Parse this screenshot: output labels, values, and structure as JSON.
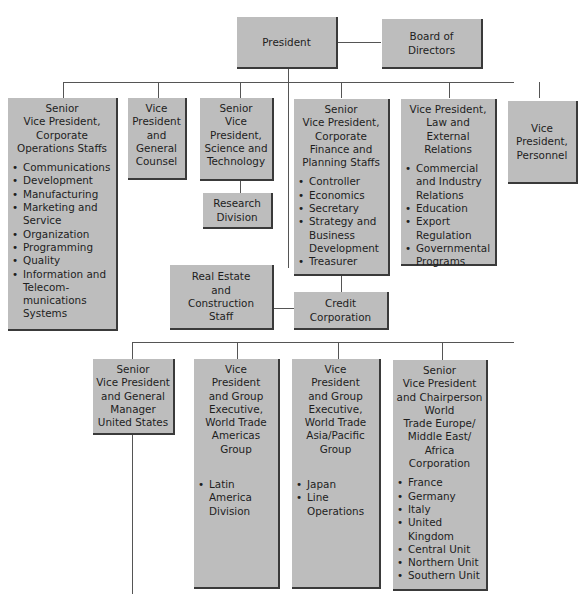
{
  "colors": {
    "box_fill": "#bdbdbd",
    "box_edge": "#3a3a3a",
    "connector": "#555555",
    "text": "#1e1e1e"
  },
  "nodes": {
    "president": {
      "title": "President"
    },
    "board": {
      "title": "Board of\nDirectors"
    },
    "svp_corp_ops": {
      "title": "Senior\nVice President,\nCorporate\nOperations Staffs",
      "items": [
        "Communications",
        "Development",
        "Manufacturing",
        "Marketing and Service",
        "Organization",
        "Programming",
        "Quality",
        "Information and Telecom-munications Systems"
      ]
    },
    "vp_general_counsel": {
      "title": "Vice\nPresident\nand\nGeneral\nCounsel"
    },
    "svp_science_tech": {
      "title": "Senior\nVice\nPresident,\nScience and\nTechnology"
    },
    "research_division": {
      "title": "Research\nDivision"
    },
    "svp_finance_planning": {
      "title": "Senior\nVice President,\nCorporate\nFinance and\nPlanning Staffs",
      "items": [
        "Controller",
        "Economics",
        "Secretary",
        "Strategy and Business Development",
        "Treasurer"
      ]
    },
    "vp_law_external": {
      "title": "Vice President,\nLaw and External\nRelations",
      "items": [
        "Commercial and Industry Relations",
        "Education",
        "Export Regulation",
        "Governmental Programs"
      ]
    },
    "vp_personnel": {
      "title": "Vice\nPresident,\nPersonnel"
    },
    "real_estate": {
      "title": "Real Estate\nand\nConstruction\nStaff"
    },
    "credit_corp": {
      "title": "Credit\nCorporation"
    },
    "svp_gm_us": {
      "title": "Senior\nVice President\nand General\nManager\nUnited States"
    },
    "vp_americas": {
      "title": "Vice\nPresident\nand Group\nExecutive,\nWorld Trade\nAmericas\nGroup",
      "items": [
        "Latin America Division"
      ]
    },
    "vp_asia_pacific": {
      "title": "Vice\nPresident\nand Group\nExecutive,\nWorld Trade\nAsia/Pacific\nGroup",
      "items": [
        "Japan",
        "Line Operations"
      ]
    },
    "svp_emea": {
      "title": "Senior\nVice President\nand Chairperson\nWorld\nTrade Europe/\nMiddle East/\nAfrica\nCorporation",
      "items": [
        "France",
        "Germany",
        "Italy",
        "United Kingdom",
        "Central Unit",
        "Northern Unit",
        "Southern Unit"
      ]
    }
  }
}
